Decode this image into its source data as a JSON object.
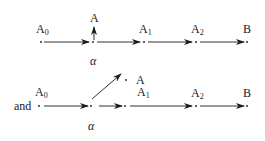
{
  "diagram": {
    "top_row": {
      "nodes": [
        {
          "label": "A",
          "sub": "0"
        },
        {
          "label": "A",
          "sub": ""
        },
        {
          "label": "A",
          "sub": "1"
        },
        {
          "label": "A",
          "sub": "2"
        },
        {
          "label": "B",
          "sub": ""
        }
      ],
      "branch_label": "α"
    },
    "connector_word": "and",
    "bottom_row": {
      "nodes": [
        {
          "label": "A",
          "sub": "0"
        },
        {
          "label": "A",
          "sub": ""
        },
        {
          "label": "A",
          "sub": "1"
        },
        {
          "label": "A",
          "sub": "2"
        },
        {
          "label": "B",
          "sub": ""
        }
      ],
      "branch_label": "α"
    }
  }
}
